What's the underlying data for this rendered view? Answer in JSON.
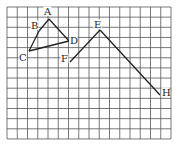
{
  "diagram": {
    "type": "grid-figure",
    "grid": {
      "columns": 16,
      "rows": 13,
      "origin_px": [
        7,
        7
      ],
      "cell_w": 10.25,
      "cell_h": 10.15,
      "line_color": "#555555",
      "border_color": "#555555"
    },
    "points": [
      {
        "label": "A",
        "x": 49,
        "y": 19,
        "lx": 44,
        "ly": 15
      },
      {
        "label": "B",
        "x": 39,
        "y": 31,
        "lx": 31,
        "ly": 29
      },
      {
        "label": "C",
        "x": 29,
        "y": 51,
        "lx": 19,
        "ly": 61
      },
      {
        "label": "D",
        "x": 69,
        "y": 41,
        "lx": 70,
        "ly": 44
      },
      {
        "label": "E",
        "x": 100,
        "y": 30,
        "lx": 94,
        "ly": 28
      },
      {
        "label": "F",
        "x": 70,
        "y": 62,
        "lx": 61,
        "ly": 62
      },
      {
        "label": "H",
        "x": 160,
        "y": 95,
        "lx": 162,
        "ly": 96
      }
    ],
    "segments": [
      [
        "A",
        "B"
      ],
      [
        "B",
        "C"
      ],
      [
        "C",
        "D"
      ],
      [
        "D",
        "A"
      ],
      [
        "F",
        "E"
      ],
      [
        "E",
        "H"
      ]
    ],
    "stroke_color": "#222222"
  }
}
